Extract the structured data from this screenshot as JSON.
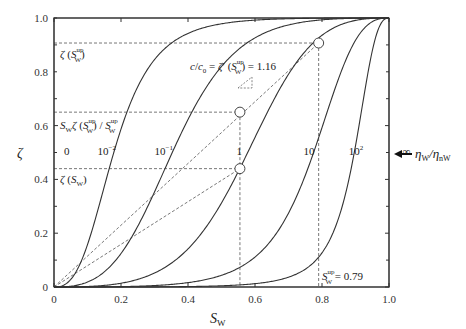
{
  "chart_data": {
    "type": "line",
    "title": "",
    "xlabel": "S_W",
    "ylabel": "ζ",
    "xlim": [
      0,
      1.0
    ],
    "ylim": [
      0,
      1.0
    ],
    "xticks": [
      0,
      0.2,
      0.4,
      0.6,
      0.8,
      1.0
    ],
    "xtick_labels": [
      "0",
      "0.2",
      "0.4",
      "0.6",
      "0.8",
      "1.0"
    ],
    "yticks": [
      0,
      0.2,
      0.4,
      0.6,
      0.8,
      1.0
    ],
    "ytick_labels": [
      "0",
      "0.2",
      "0.4",
      "0.6",
      "0.8",
      "1.0"
    ],
    "grid": false,
    "model": {
      "exponent": 2.5,
      "scale": 2.2
    },
    "series": [
      {
        "name": "0",
        "viscosity_ratio": 0
      },
      {
        "name": "10^-2",
        "viscosity_ratio": 0.01
      },
      {
        "name": "10^-1",
        "viscosity_ratio": 0.1
      },
      {
        "name": "1",
        "viscosity_ratio": 1
      },
      {
        "name": "10",
        "viscosity_ratio": 10
      },
      {
        "name": "10^2",
        "viscosity_ratio": 100
      },
      {
        "name": "∞",
        "viscosity_ratio": "infinity"
      }
    ],
    "curve_labels": [
      {
        "text": "0",
        "x": 0.03,
        "y": 0.49
      },
      {
        "text": "10",
        "sup": "−2",
        "x": 0.13,
        "y": 0.49
      },
      {
        "text": "10",
        "sup": "−1",
        "x": 0.3,
        "y": 0.49
      },
      {
        "text": "1",
        "x": 0.545,
        "y": 0.49
      },
      {
        "text": "10",
        "x": 0.745,
        "y": 0.49
      },
      {
        "text": "10",
        "sup": "2",
        "x": 0.88,
        "y": 0.49
      },
      {
        "text": "∞",
        "x": 1.04,
        "y": 0.49
      }
    ],
    "markers": [
      {
        "name": "zeta-S-w",
        "x": 0.555,
        "y": 0.44
      },
      {
        "name": "Sw-zeta-ratio",
        "x": 0.555,
        "y": 0.65
      },
      {
        "name": "zeta-S-w-up",
        "x": 0.79,
        "y": 0.907
      }
    ],
    "dashed_lines": {
      "horizontal": [
        0.907,
        0.65,
        0.44
      ],
      "vertical": [
        0.555,
        0.79
      ],
      "rays": [
        {
          "from": [
            0,
            0
          ],
          "to": [
            0.79,
            0.907
          ]
        },
        {
          "from": [
            0,
            0
          ],
          "to": [
            0.555,
            0.44
          ]
        }
      ]
    },
    "annotations": {
      "zeta_up": {
        "base": "ζ (S",
        "sub": "W",
        "sup": "up",
        "end": ")"
      },
      "sw_zeta": {
        "text": "S_W ζ (S_W^up) / S_W^up"
      },
      "zeta_sw": {
        "base": "ζ (S",
        "sub": "W",
        "end": ")"
      },
      "slope": {
        "text": "c/c₀ = ζ′(S_W^up) = 1.16",
        "value": 1.16
      },
      "sw_up": {
        "text": "S_W^up = 0.79",
        "value": 0.79
      },
      "arrow_label": "η_W/η_nW"
    }
  }
}
